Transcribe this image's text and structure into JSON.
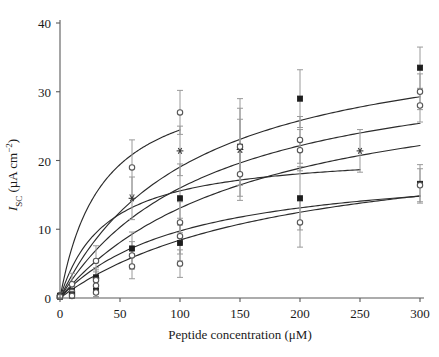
{
  "figure": {
    "background": "#ffffff",
    "plot_area": {
      "x0": 60,
      "x1": 420,
      "y0": 298,
      "y1": 23
    }
  },
  "axes": {
    "x": {
      "title": "Peptide concentration (μM)",
      "ticks": [
        0,
        50,
        100,
        150,
        200,
        250,
        300
      ],
      "tick_labels": [
        "0",
        "50",
        "100",
        "150",
        "200",
        "250",
        "300"
      ],
      "min": 0,
      "max": 300
    },
    "y": {
      "title_main": "I",
      "title_sub": "SC",
      "title_units": " (μA cm",
      "title_exp": "−2",
      "title_close": ")",
      "title_plain": "I_SC (μA cm−2)",
      "ticks": [
        0,
        10,
        20,
        30,
        40
      ],
      "tick_labels": [
        "0",
        "10",
        "20",
        "30",
        "40"
      ],
      "min": 0,
      "max": 40
    }
  },
  "colors": {
    "axis": "#5a5a5a",
    "curve": "#2b2b2b",
    "error_bar": "#9a9a9a",
    "marker_filled": "#1d1d1d",
    "marker_open_edge": "#555555",
    "marker_open_face": "#ffffff",
    "marker_star": "#3a3a3a"
  },
  "chart_data": {
    "type": "line",
    "title": "",
    "xlabel": "Peptide concentration (μM)",
    "ylabel": "I_SC (μA cm−2)",
    "xlim": [
      0,
      300
    ],
    "ylim": [
      0,
      40
    ],
    "grid": false,
    "legend": "none",
    "x_ticks": [
      0,
      50,
      100,
      150,
      200,
      250,
      300
    ],
    "y_ticks": [
      0,
      10,
      20,
      30,
      40
    ],
    "series": [
      {
        "name": "series-1-open-circle-high-affinity",
        "marker": "open-circle",
        "x": [
          0,
          10,
          30,
          60,
          100
        ],
        "y": [
          0.4,
          2.0,
          5.4,
          19.0,
          27.0
        ],
        "yerr": [
          0.3,
          1.6,
          2.2,
          4.0,
          3.2
        ],
        "curve_plateau": 33.0,
        "curve_k": 35.0
      },
      {
        "name": "series-2-asterisk-saturating-early",
        "marker": "asterisk",
        "x": [
          0,
          30,
          60,
          100,
          150,
          250
        ],
        "y": [
          0.3,
          2.9,
          14.5,
          21.4,
          21.6,
          21.4
        ],
        "yerr": [
          0.3,
          1.2,
          3.1,
          3.6,
          7.4,
          3.1
        ],
        "curve_plateau": 21.5,
        "curve_k": 38.0
      },
      {
        "name": "series-3-filled-square-upper",
        "marker": "filled-square",
        "x": [
          0,
          10,
          30,
          60,
          100,
          150,
          200,
          300
        ],
        "y": [
          0.3,
          1.0,
          3.0,
          7.2,
          14.5,
          22.0,
          29.0,
          33.5
        ],
        "yerr": [
          0.3,
          0.9,
          1.4,
          2.4,
          5.0,
          5.6,
          4.2,
          3.0
        ],
        "curve_plateau": 40.0,
        "curve_k": 110.0
      },
      {
        "name": "series-4-open-circle-mid",
        "marker": "open-circle",
        "x": [
          0,
          10,
          30,
          60,
          100,
          150,
          200,
          300
        ],
        "y": [
          0.3,
          0.9,
          2.6,
          6.2,
          11.0,
          22.0,
          23.0,
          30.0
        ],
        "yerr": [
          0.3,
          0.8,
          1.2,
          2.0,
          3.0,
          4.0,
          3.4,
          2.6
        ],
        "curve_plateau": 36.0,
        "curve_k": 125.0
      },
      {
        "name": "series-5-open-circle-lower",
        "marker": "open-circle",
        "x": [
          0,
          10,
          30,
          60,
          100,
          150,
          200,
          300
        ],
        "y": [
          0.2,
          0.6,
          1.8,
          4.6,
          9.0,
          18.0,
          21.5,
          28.0
        ],
        "yerr": [
          0.2,
          0.6,
          1.0,
          1.8,
          2.6,
          3.2,
          3.0,
          2.4
        ],
        "curve_plateau": 34.0,
        "curve_k": 160.0
      },
      {
        "name": "series-6-filled-square-low",
        "marker": "filled-square",
        "x": [
          0,
          10,
          30,
          100,
          200,
          300
        ],
        "y": [
          0.2,
          0.4,
          1.0,
          8.0,
          14.5,
          16.6
        ],
        "yerr": [
          0.2,
          0.4,
          0.8,
          2.6,
          4.6,
          2.8
        ],
        "curve_plateau": 20.0,
        "curve_k": 105.0
      },
      {
        "name": "series-7-open-circle-lowest",
        "marker": "open-circle",
        "x": [
          0,
          10,
          30,
          100,
          200,
          300
        ],
        "y": [
          0.2,
          0.3,
          0.8,
          5.0,
          11.0,
          16.4
        ],
        "yerr": [
          0.2,
          0.3,
          0.6,
          2.0,
          3.6,
          2.4
        ],
        "curve_plateau": 24.0,
        "curve_k": 185.0
      }
    ]
  }
}
